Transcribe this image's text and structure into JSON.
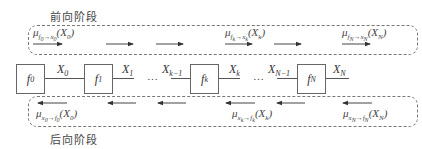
{
  "stages": {
    "forward_label": "前向阶段",
    "backward_label": "后向阶段"
  },
  "nodes": [
    {
      "id": "f0",
      "base": "f",
      "sub": "0"
    },
    {
      "id": "f1",
      "base": "f",
      "sub": "1"
    },
    {
      "id": "fk",
      "base": "f",
      "sub": "k"
    },
    {
      "id": "fN",
      "base": "f",
      "sub": "N"
    }
  ],
  "variables": [
    {
      "base": "X",
      "sub": "0"
    },
    {
      "base": "X",
      "sub": "1"
    },
    {
      "base": "X",
      "sub": "k−1"
    },
    {
      "base": "X",
      "sub": "k"
    },
    {
      "base": "X",
      "sub": "N−1"
    },
    {
      "base": "X",
      "sub": "N"
    }
  ],
  "ellipsis": "…",
  "forward_messages": [
    {
      "mu": "μ",
      "from": "f",
      "from_sub": "0",
      "arrow": "→",
      "to": "x",
      "to_sub": "0",
      "arg": "X",
      "arg_sub": "0"
    },
    {
      "mu": "μ",
      "from": "f",
      "from_sub": "k",
      "arrow": "→",
      "to": "x",
      "to_sub": "k",
      "arg": "X",
      "arg_sub": "k"
    },
    {
      "mu": "μ",
      "from": "f",
      "from_sub": "N",
      "arrow": "→",
      "to": "x",
      "to_sub": "N",
      "arg": "X",
      "arg_sub": "N"
    }
  ],
  "backward_messages": [
    {
      "mu": "μ",
      "from": "x",
      "from_sub": "0",
      "arrow": "→",
      "to": "f",
      "to_sub": "0",
      "arg": "X",
      "arg_sub": "0"
    },
    {
      "mu": "μ",
      "from": "x",
      "from_sub": "k",
      "arrow": "→",
      "to": "f",
      "to_sub": "k",
      "arg": "X",
      "arg_sub": "k"
    },
    {
      "mu": "μ",
      "from": "x",
      "from_sub": "N",
      "arrow": "→",
      "to": "f",
      "to_sub": "N",
      "arg": "X",
      "arg_sub": "N"
    }
  ],
  "colors": {
    "line": "#555555",
    "dash": "#777777",
    "text": "#333333"
  }
}
